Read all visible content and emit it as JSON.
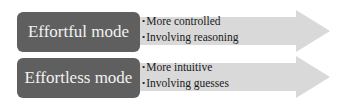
{
  "diagram": {
    "rows": [
      {
        "mode": "Effortful mode",
        "traits": [
          "More controlled",
          "Involving reasoning"
        ]
      },
      {
        "mode": "Effortless mode",
        "traits": [
          "More intuitive",
          "Involving guesses"
        ]
      }
    ],
    "colors": {
      "mode_box": "#5f5f5f",
      "mode_text": "#f2f2f2",
      "arrow_fill": "#d9d9d9",
      "trait_text": "#1a1a1a"
    }
  }
}
